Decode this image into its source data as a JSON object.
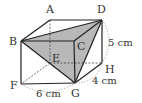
{
  "figure": {
    "type": "cuboid",
    "shaded_face": [
      "B",
      "D",
      "G"
    ],
    "vertices": [
      {
        "name": "A",
        "x": 50,
        "y": 20,
        "label_x": 46,
        "label_y": 13
      },
      {
        "name": "B",
        "x": 21,
        "y": 41,
        "label_x": 10,
        "label_y": 45
      },
      {
        "name": "C",
        "x": 74,
        "y": 41,
        "label_x": 77,
        "label_y": 50
      },
      {
        "name": "D",
        "x": 102,
        "y": 20,
        "label_x": 97,
        "label_y": 13
      },
      {
        "name": "E",
        "x": 50,
        "y": 63,
        "label_x": 53,
        "label_y": 62
      },
      {
        "name": "F",
        "x": 21,
        "y": 84,
        "label_x": 10,
        "label_y": 89
      },
      {
        "name": "G",
        "x": 75,
        "y": 83,
        "label_x": 71,
        "label_y": 97
      },
      {
        "name": "H",
        "x": 102,
        "y": 63,
        "label_x": 105,
        "label_y": 73
      }
    ],
    "labels": {
      "A": "A",
      "B": "B",
      "C": "C",
      "D": "D",
      "E": "E",
      "F": "F",
      "G": "G",
      "H": "H"
    },
    "dimensions": {
      "height": "5 cm",
      "width": "6 cm",
      "depth": "4 cm"
    },
    "colors": {
      "edge": "#222222",
      "hidden_edge": "#444444",
      "shade": "#b8b8b8",
      "arc": "#999999",
      "text": "#333333"
    }
  }
}
